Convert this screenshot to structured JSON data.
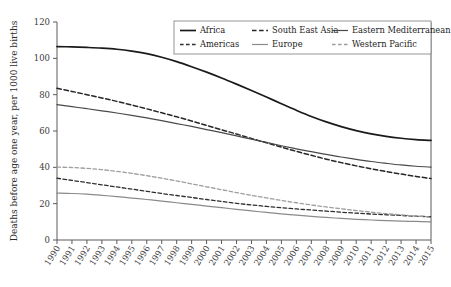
{
  "chart_data": {
    "type": "line",
    "title": "",
    "xlabel": "",
    "ylabel": "Deaths before age one year, per 1000 live births",
    "xlim": [
      1990,
      2015
    ],
    "ylim": [
      0,
      120
    ],
    "yticks": [
      0,
      20,
      40,
      60,
      80,
      100,
      120
    ],
    "grid": false,
    "legend_position": "top-right",
    "x": [
      1990,
      1991,
      1992,
      1993,
      1994,
      1995,
      1996,
      1997,
      1998,
      1999,
      2000,
      2001,
      2002,
      2003,
      2004,
      2005,
      2006,
      2007,
      2008,
      2009,
      2010,
      2011,
      2012,
      2013,
      2014,
      2015
    ],
    "categories": [
      "1990",
      "1991",
      "1992",
      "1993",
      "1994",
      "1995",
      "1996",
      "1997",
      "1998",
      "1999",
      "2000",
      "2001",
      "2002",
      "2003",
      "2004",
      "2005",
      "2006",
      "2007",
      "2008",
      "2009",
      "2010",
      "2011",
      "2012",
      "2013",
      "2014",
      "2015"
    ],
    "series": [
      {
        "name": "Africa",
        "style": "solid",
        "color": "#1a1a1a",
        "width": 1.7,
        "values": [
          106.5,
          106.3,
          106.0,
          105.6,
          105.0,
          104.0,
          102.6,
          100.6,
          98.2,
          95.4,
          92.4,
          89.2,
          85.8,
          82.3,
          78.7,
          75.0,
          71.4,
          68.0,
          65.0,
          62.4,
          60.2,
          58.4,
          57.0,
          56.0,
          55.3,
          54.8
        ]
      },
      {
        "name": "South East Asia",
        "style": "dashed",
        "color": "#262626",
        "width": 1.5,
        "values": [
          83.5,
          81.8,
          80.0,
          78.2,
          76.3,
          74.3,
          72.2,
          70.0,
          67.8,
          65.5,
          63.1,
          60.7,
          58.3,
          55.9,
          53.5,
          51.1,
          48.8,
          46.6,
          44.5,
          42.6,
          40.8,
          39.2,
          37.7,
          36.3,
          35.0,
          33.8
        ]
      },
      {
        "name": "Eastern Mediterranean",
        "style": "solid",
        "color": "#4a4a4a",
        "width": 1.2,
        "values": [
          74.5,
          73.4,
          72.3,
          71.1,
          69.9,
          68.6,
          67.2,
          65.7,
          64.1,
          62.5,
          60.8,
          59.1,
          57.3,
          55.5,
          53.7,
          51.9,
          50.2,
          48.6,
          47.1,
          45.7,
          44.4,
          43.2,
          42.2,
          41.3,
          40.6,
          40.1
        ]
      },
      {
        "name": "Americas",
        "style": "dashed",
        "color": "#2e2e2e",
        "width": 1.3,
        "values": [
          34.0,
          32.8,
          31.6,
          30.4,
          29.2,
          28.0,
          26.8,
          25.6,
          24.5,
          23.4,
          22.3,
          21.2,
          20.2,
          19.3,
          18.5,
          17.8,
          17.1,
          16.5,
          15.9,
          15.3,
          14.8,
          14.3,
          13.9,
          13.5,
          13.1,
          12.8
        ]
      },
      {
        "name": "Europe",
        "style": "solid",
        "color": "#8a8a8a",
        "width": 1.2,
        "values": [
          25.8,
          25.6,
          25.2,
          24.6,
          23.9,
          23.1,
          22.3,
          21.4,
          20.5,
          19.6,
          18.7,
          17.8,
          16.9,
          16.0,
          15.2,
          14.4,
          13.7,
          13.0,
          12.4,
          11.9,
          11.4,
          11.0,
          10.7,
          10.4,
          10.2,
          10.0
        ]
      },
      {
        "name": "Western Pacific",
        "style": "dashed",
        "color": "#9e9e9e",
        "width": 1.3,
        "values": [
          40.1,
          39.9,
          39.4,
          38.7,
          37.8,
          36.7,
          35.4,
          34.0,
          32.5,
          30.9,
          29.3,
          27.7,
          26.1,
          24.6,
          23.2,
          21.8,
          20.5,
          19.3,
          18.2,
          17.2,
          16.2,
          15.3,
          14.5,
          13.8,
          13.2,
          12.6
        ]
      }
    ],
    "legend": [
      {
        "label": "Africa",
        "style": "solid",
        "color": "#1a1a1a",
        "width": 1.7
      },
      {
        "label": "South East Asia",
        "style": "dashed",
        "color": "#262626",
        "width": 1.5
      },
      {
        "label": "Eastern Mediterranean",
        "style": "solid",
        "color": "#4a4a4a",
        "width": 1.2
      },
      {
        "label": "Americas",
        "style": "dashed",
        "color": "#2e2e2e",
        "width": 1.3
      },
      {
        "label": "Europe",
        "style": "solid",
        "color": "#8a8a8a",
        "width": 1.2
      },
      {
        "label": "Western Pacific",
        "style": "dashed",
        "color": "#9e9e9e",
        "width": 1.3
      }
    ]
  }
}
